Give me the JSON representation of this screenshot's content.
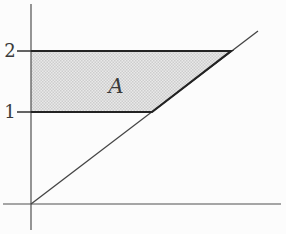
{
  "figure": {
    "labels": {
      "tick_2": "2",
      "tick_1": "1",
      "region": "A"
    },
    "colors": {
      "background": "#fcfcfc",
      "axis": "#4f4f4f",
      "border": "#232323",
      "diagonal": "#454545",
      "shade_light": "#e9e9e9",
      "shade_dark": "#cdcdcd",
      "label": "#3a3a3a"
    },
    "geometry": {
      "width": "286",
      "height": "234",
      "viewbox": "0 0 286 234",
      "y_axis": {
        "x1": "31",
        "y1": "4",
        "x2": "31",
        "y2": "230"
      },
      "x_axis": {
        "x1": "3",
        "y1": "204",
        "x2": "281",
        "y2": "204"
      },
      "diagonal": {
        "x1": "31",
        "y1": "204",
        "x2": "258",
        "y2": "31"
      },
      "region_points": "31,51 231,51 152,112 31,112",
      "region_border_points": "31,51 231,51 152,112 31,112",
      "tick_2": {
        "x1": "17",
        "y1": "51",
        "x2": "31",
        "y2": "51"
      },
      "tick_1": {
        "x1": "17",
        "y1": "112",
        "x2": "31",
        "y2": "112"
      },
      "label_2": {
        "x": "10",
        "y": "57"
      },
      "label_1": {
        "x": "10",
        "y": "118"
      },
      "label_A": {
        "x": "116",
        "y": "93"
      }
    }
  }
}
